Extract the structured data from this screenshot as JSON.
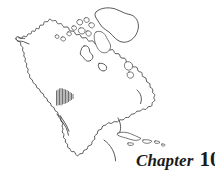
{
  "page": {
    "background_color": "#ffffff",
    "width": 215,
    "height": 180,
    "kind": "book-chapter-opener"
  },
  "chapter": {
    "word": "Chapter",
    "number": "10",
    "text_color": "#1a1a1a"
  },
  "map": {
    "title": "North America outline map",
    "line_color": "#3a3a3a",
    "fill_color": "#ffffff",
    "regions": [
      "Alaska",
      "Canada",
      "Greenland",
      "Arctic islands",
      "United States",
      "Mexico",
      "Baja California",
      "Central America",
      "Caribbean islands",
      "Hudson Bay",
      "Newfoundland"
    ],
    "highlight": {
      "name": "hatched-region",
      "style": "vertical-line hatching",
      "location": "southwestern United States",
      "line_color": "#4d4d4d",
      "x": 56,
      "y": 88,
      "width": 17,
      "height": 18
    }
  }
}
